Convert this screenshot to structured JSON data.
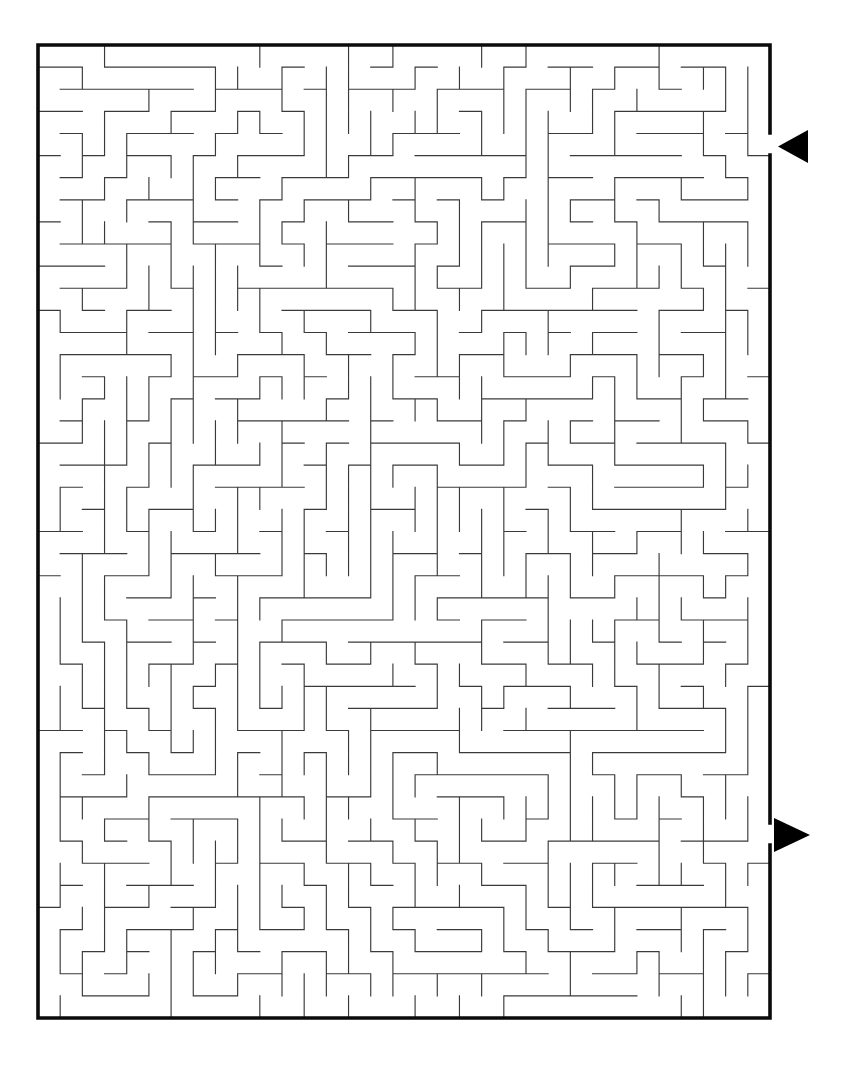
{
  "page": {
    "background_color": "#ffffff",
    "width": 859,
    "height": 1067
  },
  "maze": {
    "name": "rectangular-perfect-maze",
    "x": 38,
    "y": 45,
    "width": 732,
    "height": 973,
    "cols": 33,
    "rows": 44,
    "cell_size": 22.18,
    "wall_color": "#3a3a3a",
    "border_color": "#0b0b0b",
    "border_width": 3.6,
    "wall_width": 1.15,
    "entrance": {
      "label": "entrance",
      "side": "right",
      "row": 4,
      "arrow_direction": "left",
      "arrow_color": "#000000",
      "arrow_points": "808,130 808,163 778,146.5"
    },
    "exit": {
      "label": "exit",
      "side": "right",
      "row": 35,
      "arrow_direction": "right",
      "arrow_color": "#000000",
      "arrow_points": "774,818 774,852 810,835"
    },
    "border_segments": [
      "M38,45 L770,45",
      "M38,1018 L770,1018",
      "M38,45 L38,1018",
      "M770,45 L770,133",
      "M770,155 L770,823",
      "M770,845 L770,1018"
    ],
    "h_walls": "0000000000000000000000000000000000;100110010010101001001010010100101;011001100101010110110101101011010;110110011010100101001010010101101;001001100101011010110101101010010;110110011010100101001010010101101;001001100101011010110101101010010;110110011010100101001010010101101;001001100101011010110101101010010;110110011010100101001010010101101;001001100101011010110101101010010;110110011010100101001010010101101;001001100101011010110101101010010;110110011010100101001010010101101;001001100101011010110101101010010;110110011010100101001010010101101;001001100101011010110101101010010;110110011010100101001010010101101;001001100101011010110101101010010;110110011010100101001010010101101;001001100101011010110101101010010;110110011010100101001010010101101;001001100101011010110101101010010;110110011010100101001010010101101;001001100101011010110101101010010;110110011010100101001010010101101;001001100101011010110101101010010;110110011010100101001010010101101;001001100101011010110101101010010;110110011010100101001010010101101;001001100101011010110101101010010;110110011010100101001010010101101;001001100101011010110101101010010;110110011010100101001010010101101;001001100101011010110101101010010;110110011010100101001010010101101;001001100101011010110101101010010;110110011010100101001010010101101;001001100101011010110101101010010;110110011010100101001010010101101;001001100101011010110101101010010;110110011010100101001010010101101;001001100101011010110101101010010;110110011010100101001010010101101",
    "seed": 20240517,
    "description": "A rectangular perfect maze drawn with thin grey interior walls inside a thick black rectangular border. A solid black triangle outside the right border near the top points left into the maze marking the entrance; a second solid black triangle outside the right border near the bottom points right out of the maze marking the exit."
  }
}
